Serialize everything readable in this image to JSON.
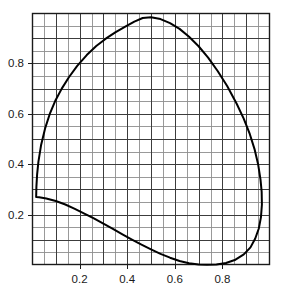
{
  "chart_data": {
    "type": "line",
    "title": "",
    "subtitle": "",
    "xlabel": "",
    "ylabel": "",
    "xlim": [
      0.0,
      1.0
    ],
    "ylim": [
      0.0,
      1.0
    ],
    "grid": true,
    "grid_minor_step": 0.05,
    "grid_major_step": 0.1,
    "legend": "none",
    "xticks": [
      0.2,
      0.4,
      0.6,
      0.8
    ],
    "yticks": [
      0.2,
      0.4,
      0.6,
      0.8
    ],
    "xtick_labels": [
      "0.2",
      "0.4",
      "0.6",
      "0.8"
    ],
    "ytick_labels": [
      "0.2",
      "0.4",
      "0.6",
      "0.8"
    ],
    "series": [
      {
        "name": "spectral-locus",
        "closed": false,
        "color": "#000000",
        "linewidth": 2.0,
        "points": [
          [
            0.0175,
            0.27
          ],
          [
            0.0185,
            0.31
          ],
          [
            0.0215,
            0.36
          ],
          [
            0.027,
            0.41
          ],
          [
            0.038,
            0.475
          ],
          [
            0.055,
            0.542
          ],
          [
            0.076,
            0.603
          ],
          [
            0.099,
            0.654
          ],
          [
            0.125,
            0.7
          ],
          [
            0.155,
            0.745
          ],
          [
            0.19,
            0.79
          ],
          [
            0.23,
            0.833
          ],
          [
            0.27,
            0.869
          ],
          [
            0.31,
            0.898
          ],
          [
            0.35,
            0.923
          ],
          [
            0.39,
            0.945
          ],
          [
            0.43,
            0.966
          ],
          [
            0.465,
            0.98
          ],
          [
            0.5,
            0.983
          ],
          [
            0.54,
            0.976
          ],
          [
            0.58,
            0.96
          ],
          [
            0.62,
            0.937
          ],
          [
            0.66,
            0.906
          ],
          [
            0.7,
            0.868
          ],
          [
            0.74,
            0.823
          ],
          [
            0.78,
            0.77
          ],
          [
            0.82,
            0.71
          ],
          [
            0.86,
            0.64
          ],
          [
            0.89,
            0.58
          ],
          [
            0.915,
            0.52
          ],
          [
            0.935,
            0.46
          ],
          [
            0.95,
            0.4
          ],
          [
            0.96,
            0.34
          ],
          [
            0.965,
            0.29
          ],
          [
            0.966,
            0.24
          ],
          [
            0.962,
            0.19
          ],
          [
            0.953,
            0.145
          ],
          [
            0.938,
            0.105
          ],
          [
            0.918,
            0.07
          ],
          [
            0.89,
            0.042
          ],
          [
            0.855,
            0.021
          ],
          [
            0.815,
            0.008
          ],
          [
            0.775,
            0.002
          ],
          [
            0.735,
            0.0005
          ],
          [
            0.7,
            0.002
          ],
          [
            0.66,
            0.007
          ],
          [
            0.62,
            0.016
          ],
          [
            0.58,
            0.029
          ],
          [
            0.54,
            0.044
          ],
          [
            0.5,
            0.062
          ],
          [
            0.46,
            0.081
          ],
          [
            0.42,
            0.101
          ],
          [
            0.38,
            0.122
          ],
          [
            0.34,
            0.143
          ],
          [
            0.3,
            0.164
          ],
          [
            0.26,
            0.185
          ],
          [
            0.22,
            0.204
          ],
          [
            0.18,
            0.223
          ],
          [
            0.14,
            0.24
          ],
          [
            0.1,
            0.254
          ],
          [
            0.06,
            0.264
          ],
          [
            0.03,
            0.269
          ],
          [
            0.0175,
            0.27
          ]
        ]
      }
    ]
  },
  "axes": {
    "plot_left_px": 32,
    "plot_top_px": 13,
    "plot_right_px": 270,
    "plot_bottom_px": 265
  },
  "style": {
    "frame_color": "#1a1a1a",
    "grid_minor_color": "#8e8e8e",
    "grid_major_color": "#3c3c3c",
    "curve_color": "#000000",
    "background": "#ffffff",
    "tick_label_color": "#1a1a1a"
  }
}
